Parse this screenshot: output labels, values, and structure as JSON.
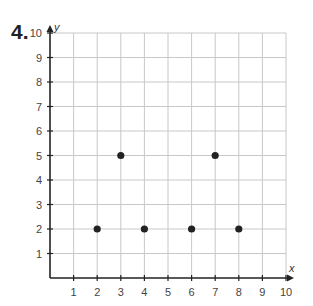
{
  "problem": {
    "number": "4."
  },
  "chart_data": {
    "type": "scatter",
    "title": "",
    "xlabel": "x",
    "ylabel": "y",
    "xlim": [
      0,
      10
    ],
    "ylim": [
      0,
      10
    ],
    "grid": true,
    "x_ticks": [
      1,
      2,
      3,
      4,
      5,
      6,
      7,
      8,
      9,
      10
    ],
    "y_ticks": [
      1,
      2,
      3,
      4,
      5,
      6,
      7,
      8,
      9,
      10
    ],
    "points": [
      {
        "x": 2,
        "y": 2
      },
      {
        "x": 3,
        "y": 5
      },
      {
        "x": 4,
        "y": 2
      },
      {
        "x": 6,
        "y": 2
      },
      {
        "x": 7,
        "y": 5
      },
      {
        "x": 8,
        "y": 2
      }
    ],
    "colors": {
      "grid": "#c8c8c8",
      "axis": "#222222",
      "point": "#222222"
    }
  }
}
